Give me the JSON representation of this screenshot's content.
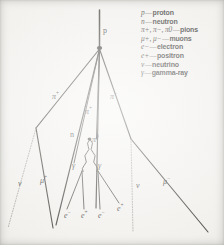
{
  "figure": {
    "type": "particle-shower-diagram",
    "background_color": "#f2f1ee",
    "ink_color": "#1a1917"
  },
  "legend": {
    "entries": [
      {
        "symbol": "p",
        "dash": "—",
        "name": "proton"
      },
      {
        "symbol": "n",
        "dash": "—",
        "name": "neutron"
      },
      {
        "symbol": "π+, π−, π0",
        "dash": "—",
        "name": "pions"
      },
      {
        "symbol": "μ+, μ−",
        "dash": "—",
        "name": "muons"
      },
      {
        "symbol": "e−",
        "dash": "—",
        "name": "electron"
      },
      {
        "symbol": "e+",
        "dash": "—",
        "name": "positron"
      },
      {
        "symbol": "ν",
        "dash": "—",
        "name": "neutrino"
      },
      {
        "symbol": "γ",
        "dash": "—",
        "name": "gamma-ray"
      }
    ]
  },
  "track_labels": [
    {
      "id": "primary-proton",
      "text": "p",
      "x": 103,
      "y": 27
    },
    {
      "id": "pion-plus-left",
      "text": "π+",
      "x": 52,
      "y": 93
    },
    {
      "id": "pion-minus-right",
      "text": "π−",
      "x": 110,
      "y": 93
    },
    {
      "id": "pion-plus-center",
      "text": "π+",
      "x": 85,
      "y": 108
    },
    {
      "id": "neutron-center",
      "text": "n",
      "x": 70,
      "y": 131
    },
    {
      "id": "pion-zero",
      "text": "π0",
      "x": 92,
      "y": 136
    },
    {
      "id": "gamma-left",
      "text": "γ",
      "x": 72,
      "y": 162
    },
    {
      "id": "gamma-right",
      "text": "γ",
      "x": 98,
      "y": 162
    },
    {
      "id": "neutrino-left",
      "text": "ν",
      "x": 18,
      "y": 180
    },
    {
      "id": "muon-plus",
      "text": "μ+",
      "x": 40,
      "y": 177
    },
    {
      "id": "neutrino-right",
      "text": "ν",
      "x": 136,
      "y": 182
    },
    {
      "id": "muon-minus",
      "text": "μ−",
      "x": 163,
      "y": 178
    },
    {
      "id": "electron-1",
      "text": "e−",
      "x": 64,
      "y": 212
    },
    {
      "id": "positron-1",
      "text": "e+",
      "x": 81,
      "y": 212
    },
    {
      "id": "electron-2",
      "text": "e−",
      "x": 98,
      "y": 212
    },
    {
      "id": "positron-2",
      "text": "e+",
      "x": 117,
      "y": 205
    }
  ]
}
